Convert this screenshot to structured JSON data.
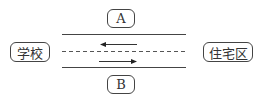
{
  "diagram": {
    "labels": {
      "school": "学校",
      "residential_area": "住宅区",
      "side_a": "A",
      "side_b": "B"
    },
    "road": {
      "lanes": [
        {
          "direction": "left",
          "position": "upper"
        },
        {
          "direction": "right",
          "position": "lower"
        }
      ],
      "center_line": "dashed"
    }
  }
}
